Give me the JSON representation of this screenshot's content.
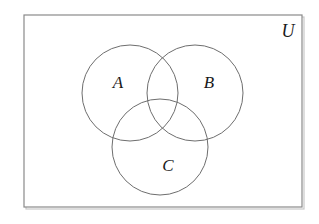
{
  "figure": {
    "kind": "venn-diagram",
    "caption": "",
    "background_color": "#ffffff",
    "width": 319,
    "height": 224
  },
  "universe": {
    "label": "U",
    "label_x": 288,
    "label_y": 33,
    "rect": {
      "x": 24,
      "y": 15,
      "width": 278,
      "height": 192
    },
    "stroke_color": "#8a8a8a",
    "fill_color": "#ffffff"
  },
  "sets": [
    {
      "label": "A",
      "cx": 130,
      "cy": 93,
      "r": 48,
      "label_x": 118,
      "label_y": 84,
      "stroke_color": "#6e6e6e"
    },
    {
      "label": "B",
      "cx": 195,
      "cy": 93,
      "r": 48,
      "label_x": 209,
      "label_y": 84,
      "stroke_color": "#6e6e6e"
    },
    {
      "label": "C",
      "cx": 160,
      "cy": 147,
      "r": 48,
      "label_x": 168,
      "label_y": 167,
      "stroke_color": "#6e6e6e"
    }
  ]
}
